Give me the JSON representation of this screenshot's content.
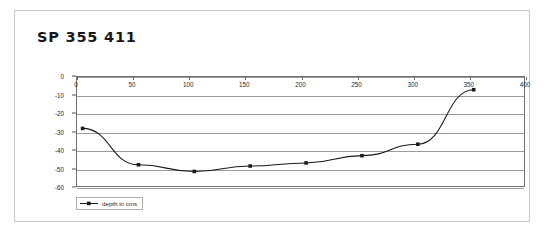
{
  "title": "SP 355 411",
  "legend": {
    "label": "depth in cms",
    "marker": "line-with-square-marker"
  },
  "chart_data": {
    "type": "line",
    "title": "SP 355 411",
    "xlabel": "",
    "ylabel": "",
    "xlim": [
      0,
      400
    ],
    "ylim": [
      -60,
      0
    ],
    "xticks": [
      0,
      50,
      100,
      150,
      200,
      250,
      300,
      350,
      400
    ],
    "yticks": [
      0,
      -10,
      -20,
      -30,
      -40,
      -50,
      -60
    ],
    "xtick_labels": [
      "0",
      "50",
      "100",
      "150",
      "200",
      "250",
      "300",
      "350",
      "400"
    ],
    "ytick_labels": [
      "0",
      "-10",
      "-20",
      "-30",
      "-40",
      "-50",
      "-60"
    ],
    "grid": "horizontal",
    "legend_position": "below-left",
    "series": [
      {
        "name": "depth in cms",
        "color": "#1a1a1a",
        "marker": "square",
        "x": [
          5,
          55,
          105,
          155,
          205,
          255,
          305,
          355
        ],
        "values": [
          -28.3,
          -48.3,
          -52.0,
          -49.0,
          -47.3,
          -43.3,
          -37.0,
          -7.0
        ]
      }
    ]
  }
}
